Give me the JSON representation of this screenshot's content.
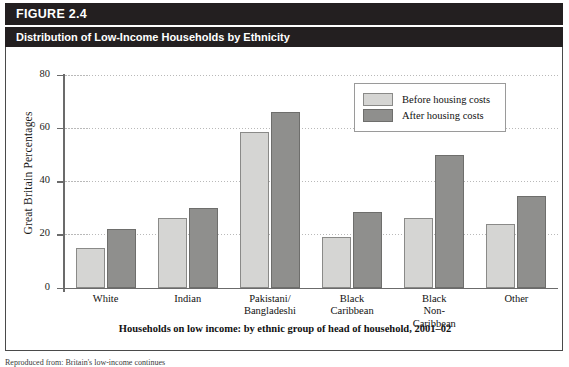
{
  "figure": {
    "number_label": "FIGURE 2.4",
    "subtitle": "Distribution of Low-Income Households by Ethnicity",
    "caption": "Households on low income: by ethnic group of head of household, 2001–02",
    "source_note": "Reproduced from: Britain's low-income continues",
    "colors": {
      "header_background": "#231f20",
      "header_text": "#ffffff",
      "before_bar": "#d5d5d3",
      "after_bar": "#8f8f8d",
      "border": "#4a4a4a",
      "gridline": "#b9b9b9"
    }
  },
  "legend": {
    "position": "top-right",
    "entries": [
      {
        "label": "Before housing costs",
        "swatch": "before"
      },
      {
        "label": "After housing costs",
        "swatch": "after"
      }
    ]
  },
  "chart_data": {
    "type": "bar",
    "title": "Distribution of Low-Income Households by Ethnicity",
    "subtitle": "Households on low income: by ethnic group of head of household, 2001–02",
    "xlabel": "",
    "ylabel": "Great Britain Percentages",
    "ylim": [
      0,
      80
    ],
    "yticks": [
      0,
      20,
      40,
      60,
      80
    ],
    "ytick_labels": [
      "0",
      "20",
      "40",
      "60",
      "80"
    ],
    "grid": "horizontal-dotted",
    "legend_position": "upper right",
    "categories": [
      "White",
      "Indian",
      "Pakistani/\nBangladeshi",
      "Black\nCaribbean",
      "Black\nNon-\nCaribbean",
      "Other"
    ],
    "category_lines": [
      [
        "White"
      ],
      [
        "Indian"
      ],
      [
        "Pakistani/",
        "Bangladeshi"
      ],
      [
        "Black",
        "Caribbean"
      ],
      [
        "Black",
        "Non-",
        "Caribbean"
      ],
      [
        "Other"
      ]
    ],
    "series": [
      {
        "name": "Before housing costs",
        "color": "#d5d5d3",
        "values": [
          15,
          26,
          58.5,
          19,
          26,
          24
        ]
      },
      {
        "name": "After housing costs",
        "color": "#8f8f8d",
        "values": [
          22,
          30,
          66,
          28.5,
          50,
          34.5
        ]
      }
    ]
  }
}
